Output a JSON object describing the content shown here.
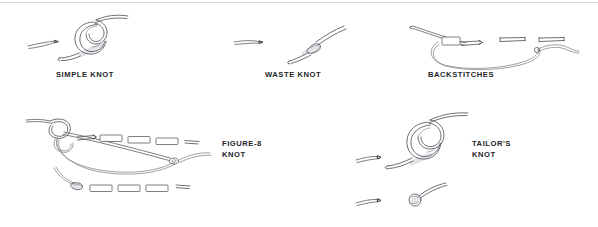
{
  "page": {
    "background_color": "#ffffff",
    "rule_color": "#d8d8da",
    "ink_color": "#5d6066",
    "label_color": "#232529"
  },
  "figures": [
    {
      "id": "simple-knot",
      "label": "SIMPLE KNOT",
      "label_lines": "SIMPLE KNOT",
      "illustration": "overhand knot tied in thread with short thread tail at left",
      "position": {
        "x": 22,
        "y": 8
      },
      "label_position": {
        "x": 56,
        "y": 70
      }
    },
    {
      "id": "waste-knot",
      "label": "WASTE KNOT",
      "label_lines": "WASTE KNOT",
      "illustration": "small knot on fabric surface with thread tail segment at left",
      "position": {
        "x": 232,
        "y": 26
      },
      "label_position": {
        "x": 265,
        "y": 70
      }
    },
    {
      "id": "backstitches",
      "label": "BACKSTITCHES",
      "label_lines": "BACKSTITCHES",
      "illustration": "threaded needle pulling through fabric forming a row of backstitches",
      "position": {
        "x": 412,
        "y": 22
      },
      "label_position": {
        "x": 428,
        "y": 70
      }
    },
    {
      "id": "figure-8-knot",
      "label": "FIGURE-8 KNOT",
      "label_lines": "FIGURE-8\nKNOT",
      "illustration": "figure-eight knot with long threaded needle and two rows of stitches",
      "position": {
        "x": 26,
        "y": 112
      },
      "label_position": {
        "x": 222,
        "y": 139
      }
    },
    {
      "id": "tailors-knot",
      "label": "TAILOR'S KNOT",
      "label_lines": "TAILOR'S\nKNOT",
      "illustration": "tailor's knot looped around needle with thread tails, plus detail below",
      "position": {
        "x": 352,
        "y": 112
      },
      "label_position": {
        "x": 472,
        "y": 139
      }
    }
  ]
}
